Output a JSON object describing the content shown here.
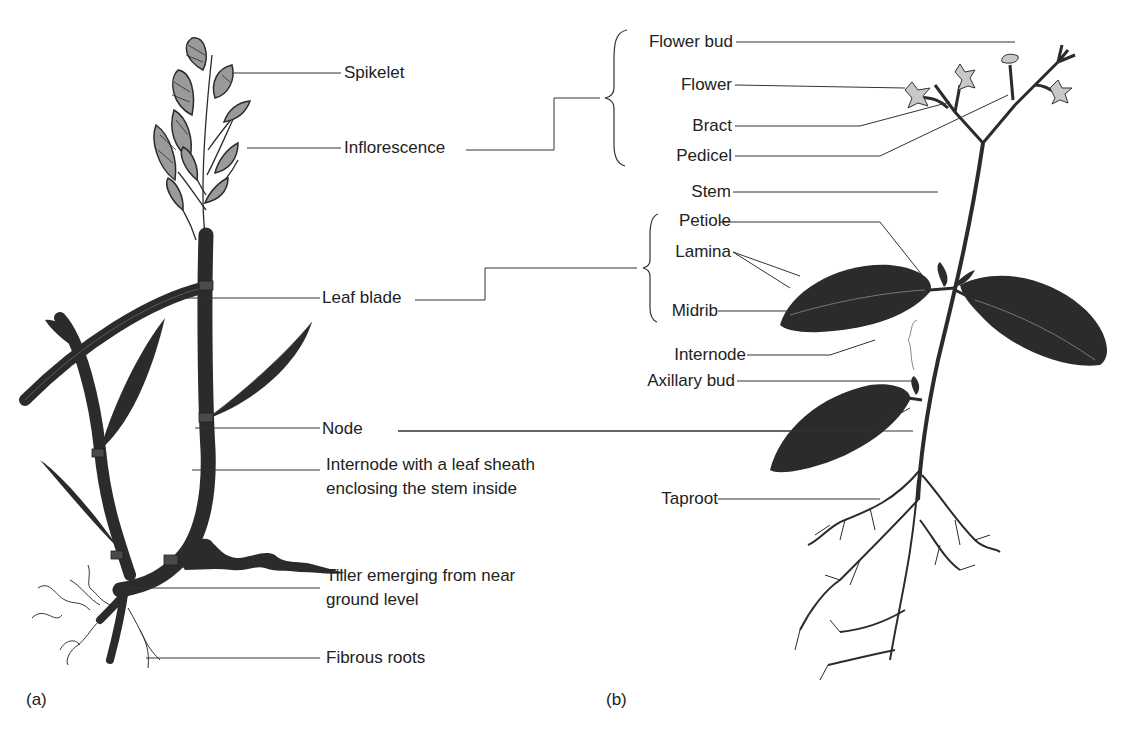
{
  "figure": {
    "panels": [
      {
        "id": "a",
        "caption": "(a)",
        "subject": "grass (monocot) plant",
        "labels": {
          "spikelet": "Spikelet",
          "inflorescence": "Inflorescence",
          "leaf_blade": "Leaf blade",
          "node": "Node",
          "internode_line1": "Internode with a leaf sheath",
          "internode_line2": "enclosing the stem inside",
          "tiller_line1": "Tiller emerging from near",
          "tiller_line2": "ground level",
          "fibrous_roots": "Fibrous roots"
        }
      },
      {
        "id": "b",
        "caption": "(b)",
        "subject": "dicot plant",
        "labels": {
          "flower_bud": "Flower bud",
          "flower": "Flower",
          "bract": "Bract",
          "pedicel": "Pedicel",
          "stem": "Stem",
          "petiole": "Petiole",
          "lamina": "Lamina",
          "midrib": "Midrib",
          "internode": "Internode",
          "axillary_bud": "Axillary bud",
          "taproot": "Taproot"
        }
      }
    ],
    "colors": {
      "line": "#333333",
      "plant_dark": "#2b2b2b",
      "spikelet_fill": "#9a9a9a",
      "flower_fill": "#c8c8c8",
      "background": "#ffffff"
    }
  }
}
